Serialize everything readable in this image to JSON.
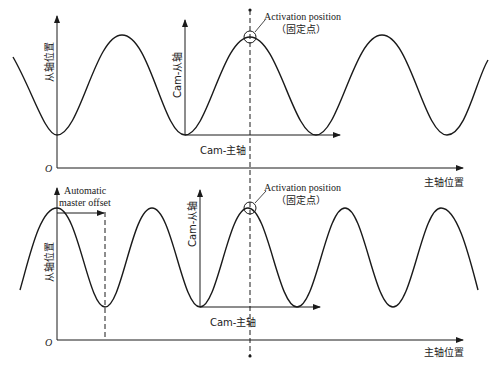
{
  "diagram": {
    "top_panel": {
      "y_axis_label": "从轴位置",
      "x_axis_label": "主轴位置",
      "origin_label": "O",
      "cam_slave_label": "Cam-从轴",
      "cam_master_label": "Cam-主轴",
      "activation_label": "Activation position",
      "activation_sub_label": "（固定点）"
    },
    "bottom_panel": {
      "y_axis_label": "从轴位置",
      "x_axis_label": "主轴位置",
      "origin_label": "O",
      "offset_label_line1": "Automatic",
      "offset_label_line2": "master offset",
      "cam_slave_label": "Cam-从轴",
      "cam_master_label": "Cam-主轴",
      "activation_label": "Activation position",
      "activation_sub_label": "（固定点）"
    },
    "colors": {
      "line": "#1a1a1a",
      "background": "#ffffff"
    }
  }
}
